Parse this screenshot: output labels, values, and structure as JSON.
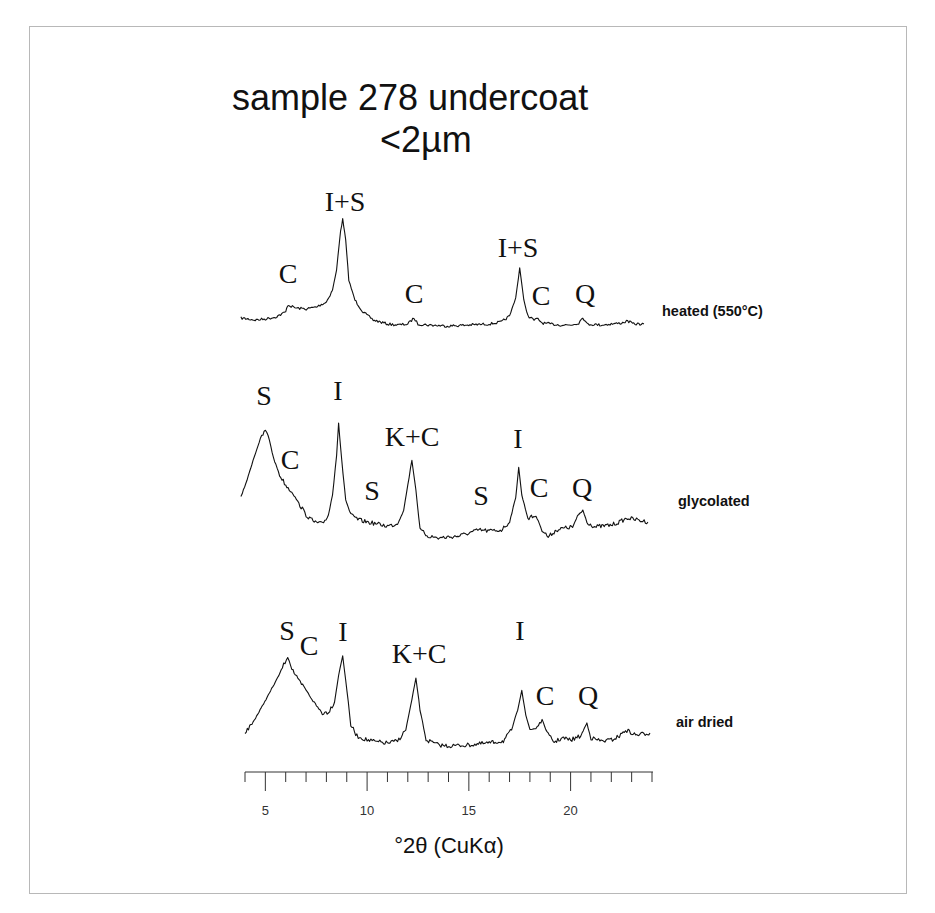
{
  "title_line1": "sample 278 undercoat",
  "title_line2": "<2µm",
  "chart_data": {
    "type": "line",
    "xlabel": "°2θ (CuKα)",
    "ylabel": "",
    "xlim": [
      4,
      24
    ],
    "x_ticks_major": [
      5,
      10,
      15,
      20
    ],
    "x_ticks_minor_step": 1,
    "grid": false,
    "y_axis_shown": false,
    "legend": "series labelled inline on right",
    "series": [
      {
        "name": "heated (550°C)",
        "offset_y": 0,
        "points": [
          [
            3.8,
            318
          ],
          [
            4.5,
            320
          ],
          [
            5,
            319
          ],
          [
            5.5,
            317
          ],
          [
            6,
            312
          ],
          [
            6.1,
            305
          ],
          [
            6.5,
            308
          ],
          [
            7,
            309
          ],
          [
            7.5,
            307
          ],
          [
            8,
            302
          ],
          [
            8.3,
            290
          ],
          [
            8.5,
            270
          ],
          [
            8.7,
            230
          ],
          [
            8.8,
            219
          ],
          [
            8.95,
            240
          ],
          [
            9.1,
            280
          ],
          [
            9.4,
            300
          ],
          [
            9.8,
            312
          ],
          [
            10.3,
            320
          ],
          [
            11,
            324
          ],
          [
            11.5,
            325
          ],
          [
            12,
            324
          ],
          [
            12.3,
            318
          ],
          [
            12.5,
            324
          ],
          [
            13,
            325
          ],
          [
            14,
            326
          ],
          [
            15,
            325
          ],
          [
            16,
            324
          ],
          [
            16.6,
            322
          ],
          [
            17,
            316
          ],
          [
            17.3,
            298
          ],
          [
            17.5,
            268
          ],
          [
            17.7,
            300
          ],
          [
            17.9,
            316
          ],
          [
            18.2,
            320
          ],
          [
            18.4,
            319
          ],
          [
            18.6,
            323
          ],
          [
            19,
            324
          ],
          [
            19.5,
            325
          ],
          [
            20,
            325
          ],
          [
            20.4,
            323
          ],
          [
            20.6,
            317
          ],
          [
            20.8,
            324
          ],
          [
            21.5,
            325
          ],
          [
            22,
            324
          ],
          [
            22.5,
            323
          ],
          [
            22.8,
            321
          ],
          [
            23.1,
            324
          ],
          [
            23.6,
            324
          ]
        ],
        "peak_labels": [
          {
            "text": "C",
            "x": 6.1,
            "label_x": 288,
            "label_y": 283
          },
          {
            "text": "I+S",
            "x": 8.8,
            "label_x": 345,
            "label_y": 211
          },
          {
            "text": "C",
            "x": 12.3,
            "label_x": 414,
            "label_y": 303
          },
          {
            "text": "I+S",
            "x": 17.5,
            "label_x": 518,
            "label_y": 257
          },
          {
            "text": "C",
            "x": 18.5,
            "label_x": 541,
            "label_y": 305
          },
          {
            "text": "Q",
            "x": 20.6,
            "label_x": 585,
            "label_y": 303
          }
        ]
      },
      {
        "name": "glycolated",
        "offset_y": 0,
        "points": [
          [
            3.8,
            497
          ],
          [
            4.1,
            480
          ],
          [
            4.4,
            460
          ],
          [
            4.7,
            442
          ],
          [
            5,
            430
          ],
          [
            5.2,
            440
          ],
          [
            5.4,
            458
          ],
          [
            5.7,
            475
          ],
          [
            6,
            485
          ],
          [
            6.3,
            492
          ],
          [
            6.7,
            505
          ],
          [
            7,
            515
          ],
          [
            7.4,
            522
          ],
          [
            7.8,
            524
          ],
          [
            8.1,
            515
          ],
          [
            8.3,
            495
          ],
          [
            8.5,
            455
          ],
          [
            8.6,
            423
          ],
          [
            8.75,
            460
          ],
          [
            8.95,
            500
          ],
          [
            9.2,
            515
          ],
          [
            9.6,
            520
          ],
          [
            10,
            522
          ],
          [
            10.5,
            524
          ],
          [
            11,
            526
          ],
          [
            11.5,
            524
          ],
          [
            11.8,
            510
          ],
          [
            12,
            485
          ],
          [
            12.2,
            460
          ],
          [
            12.4,
            490
          ],
          [
            12.6,
            530
          ],
          [
            13,
            536
          ],
          [
            13.5,
            538
          ],
          [
            14,
            537
          ],
          [
            14.5,
            536
          ],
          [
            15,
            533
          ],
          [
            15.5,
            530
          ],
          [
            16,
            531
          ],
          [
            16.6,
            530
          ],
          [
            17,
            522
          ],
          [
            17.3,
            498
          ],
          [
            17.45,
            467
          ],
          [
            17.6,
            495
          ],
          [
            17.9,
            518
          ],
          [
            18.3,
            516
          ],
          [
            18.6,
            530
          ],
          [
            18.9,
            537
          ],
          [
            19.3,
            530
          ],
          [
            19.7,
            528
          ],
          [
            20.1,
            527
          ],
          [
            20.4,
            515
          ],
          [
            20.6,
            510
          ],
          [
            20.8,
            522
          ],
          [
            21.2,
            527
          ],
          [
            21.6,
            526
          ],
          [
            22,
            525
          ],
          [
            22.4,
            522
          ],
          [
            22.8,
            518
          ],
          [
            23.3,
            520
          ],
          [
            23.8,
            522
          ]
        ],
        "peak_labels": [
          {
            "text": "S",
            "x": 5.0,
            "label_x": 264,
            "label_y": 405
          },
          {
            "text": "C",
            "x": 6.1,
            "label_x": 290,
            "label_y": 469
          },
          {
            "text": "I",
            "x": 8.6,
            "label_x": 338,
            "label_y": 400
          },
          {
            "text": "S",
            "x": 10.2,
            "label_x": 372,
            "label_y": 500
          },
          {
            "text": "K+C",
            "x": 12.3,
            "label_x": 412,
            "label_y": 446
          },
          {
            "text": "S",
            "x": 15.6,
            "label_x": 481,
            "label_y": 505
          },
          {
            "text": "I",
            "x": 17.45,
            "label_x": 518,
            "label_y": 448
          },
          {
            "text": "C",
            "x": 18.3,
            "label_x": 539,
            "label_y": 497
          },
          {
            "text": "Q",
            "x": 20.6,
            "label_x": 582,
            "label_y": 497
          }
        ]
      },
      {
        "name": "air dried",
        "offset_y": 0,
        "points": [
          [
            4,
            733
          ],
          [
            4.4,
            722
          ],
          [
            4.8,
            708
          ],
          [
            5.2,
            693
          ],
          [
            5.6,
            678
          ],
          [
            5.9,
            665
          ],
          [
            6.1,
            656
          ],
          [
            6.3,
            668
          ],
          [
            6.6,
            680
          ],
          [
            7,
            690
          ],
          [
            7.4,
            703
          ],
          [
            7.8,
            713
          ],
          [
            8.1,
            712
          ],
          [
            8.4,
            702
          ],
          [
            8.6,
            675
          ],
          [
            8.8,
            656
          ],
          [
            8.95,
            680
          ],
          [
            9.2,
            725
          ],
          [
            9.5,
            736
          ],
          [
            10,
            740
          ],
          [
            10.5,
            742
          ],
          [
            11,
            743
          ],
          [
            11.5,
            741
          ],
          [
            11.9,
            730
          ],
          [
            12.2,
            700
          ],
          [
            12.4,
            678
          ],
          [
            12.6,
            710
          ],
          [
            12.9,
            740
          ],
          [
            13.5,
            745
          ],
          [
            14,
            746
          ],
          [
            15,
            745
          ],
          [
            16,
            743
          ],
          [
            16.7,
            741
          ],
          [
            17.1,
            730
          ],
          [
            17.4,
            710
          ],
          [
            17.6,
            690
          ],
          [
            17.8,
            715
          ],
          [
            18,
            730
          ],
          [
            18.3,
            728
          ],
          [
            18.6,
            720
          ],
          [
            18.9,
            735
          ],
          [
            19.2,
            742
          ],
          [
            19.6,
            738
          ],
          [
            20,
            740
          ],
          [
            20.5,
            736
          ],
          [
            20.8,
            723
          ],
          [
            21,
            738
          ],
          [
            21.5,
            741
          ],
          [
            22,
            740
          ],
          [
            22.4,
            736
          ],
          [
            22.7,
            730
          ],
          [
            23.2,
            735
          ],
          [
            23.9,
            733
          ]
        ],
        "peak_labels": [
          {
            "text": "S",
            "x": 6.1,
            "label_x": 287,
            "label_y": 640
          },
          {
            "text": "C",
            "x": 7.2,
            "label_x": 309,
            "label_y": 655
          },
          {
            "text": "I",
            "x": 8.8,
            "label_x": 343,
            "label_y": 641
          },
          {
            "text": "K+C",
            "x": 12.4,
            "label_x": 419,
            "label_y": 663
          },
          {
            "text": "I",
            "x": 17.6,
            "label_x": 520,
            "label_y": 640
          },
          {
            "text": "C",
            "x": 18.6,
            "label_x": 545,
            "label_y": 705
          },
          {
            "text": "Q",
            "x": 20.9,
            "label_x": 588,
            "label_y": 705
          }
        ]
      }
    ]
  },
  "series_labels": [
    {
      "text": "heated (550°C)",
      "x": 662,
      "y": 316
    },
    {
      "text": "glycolated",
      "x": 678,
      "y": 506
    },
    {
      "text": "air dried",
      "x": 676,
      "y": 727
    }
  ],
  "axis": {
    "title": "°2θ (CuKα)",
    "tick_labels": [
      "5",
      "10",
      "15",
      "20"
    ]
  }
}
